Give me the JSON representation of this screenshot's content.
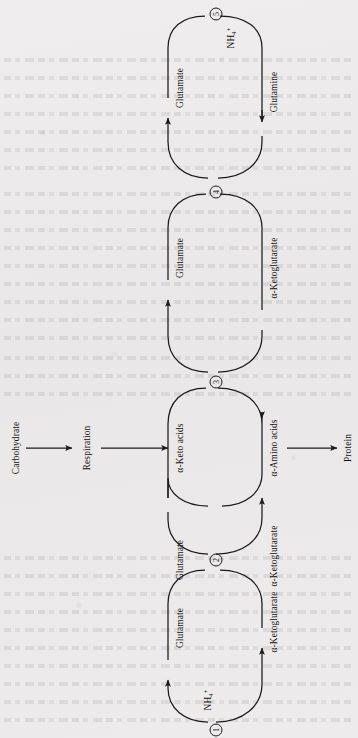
{
  "figure": {
    "type": "biochemical-pathway-diagram",
    "orientation": "rotated-90-ccw",
    "background_color": "#eceaea",
    "line_color": "#1c1c1c"
  },
  "main_chain": {
    "nodes": [
      {
        "id": "carbohydrate",
        "label": "Carbohydrate"
      },
      {
        "id": "respiration",
        "label": "Respiration"
      },
      {
        "id": "keto-acids",
        "label": "α-Keto acids"
      },
      {
        "id": "amino-acids",
        "label": "α-Amino acids"
      },
      {
        "id": "protein",
        "label": "Protein"
      }
    ],
    "arrows": [
      {
        "from": "carbohydrate",
        "to": "respiration"
      },
      {
        "from": "respiration",
        "to": "keto-acids"
      },
      {
        "from": "amino-acids",
        "to": "protein"
      }
    ]
  },
  "cycles": [
    {
      "number": "1",
      "circled_number": "①",
      "left_label": "Glutamate",
      "right_label": "α-Ketoglutarate",
      "reagent": "NH₄⁺",
      "reagent_html": "NH<sub>4</sub><sup>+</sup>",
      "description": "Glutamate dehydrogenase: α-ketoglutarate + NH₄⁺ → glutamate"
    },
    {
      "number": "2",
      "circled_number": "②",
      "left_label": "Glutamate",
      "right_label": "α-Ketoglutarate",
      "reagent": "",
      "reagent_html": "",
      "description": "Glutamate → α-ketoglutarate (transamination donor)"
    },
    {
      "number": "3",
      "circled_number": "③",
      "left_label": "α-Keto acids",
      "right_label": "α-Amino acids",
      "reagent": "",
      "reagent_html": "",
      "description": "Transamination: α-keto acids → α-amino acids"
    },
    {
      "number": "4",
      "circled_number": "④",
      "left_label": "Glutamate",
      "right_label": "α-Ketoglutarate",
      "reagent": "",
      "reagent_html": "",
      "description": "Glutamate / α-ketoglutarate interconversion"
    },
    {
      "number": "5",
      "circled_number": "⑤",
      "left_label": "Glutamate",
      "right_label": "Glutamine",
      "reagent": "NH₄⁺",
      "reagent_html": "NH<sub>4</sub><sup>+</sup>",
      "description": "Glutamine synthetase: glutamate + NH₄⁺ → glutamine"
    }
  ]
}
